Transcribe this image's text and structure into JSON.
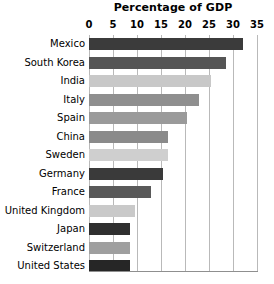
{
  "chart_data": {
    "type": "bar",
    "orientation": "horizontal",
    "title": "Percentage of GDP",
    "xlabel": "",
    "ylabel": "",
    "xlim": [
      0,
      35
    ],
    "ylim": null,
    "grid": "vertical",
    "legend": "none",
    "xticks": [
      0,
      5,
      10,
      15,
      20,
      25,
      30,
      35
    ],
    "xtick_labels": [
      "0",
      "5",
      "10",
      "15",
      "20",
      "25",
      "30",
      "35"
    ],
    "categories": [
      "Mexico",
      "South Korea",
      "India",
      "Italy",
      "Spain",
      "China",
      "Sweden",
      "Germany",
      "France",
      "United Kingdom",
      "Japan",
      "Switzerland",
      "United States"
    ],
    "values": [
      32.0,
      28.5,
      25.5,
      23.0,
      20.5,
      16.5,
      16.5,
      15.5,
      13.0,
      9.5,
      8.5,
      8.5,
      8.5
    ],
    "bar_colors": [
      "#3b3b3b",
      "#555555",
      "#c8c8c8",
      "#8f8f8f",
      "#9a9a9a",
      "#8a8a8a",
      "#cfcfcf",
      "#3a3a3a",
      "#595959",
      "#c9c9c9",
      "#2f2f2f",
      "#9f9f9f",
      "#262626"
    ]
  },
  "style": {
    "background": "#ffffff",
    "gridline_color": "#b9b9b9",
    "axis_color": "#8f8f8f",
    "text_color": "#000000"
  }
}
